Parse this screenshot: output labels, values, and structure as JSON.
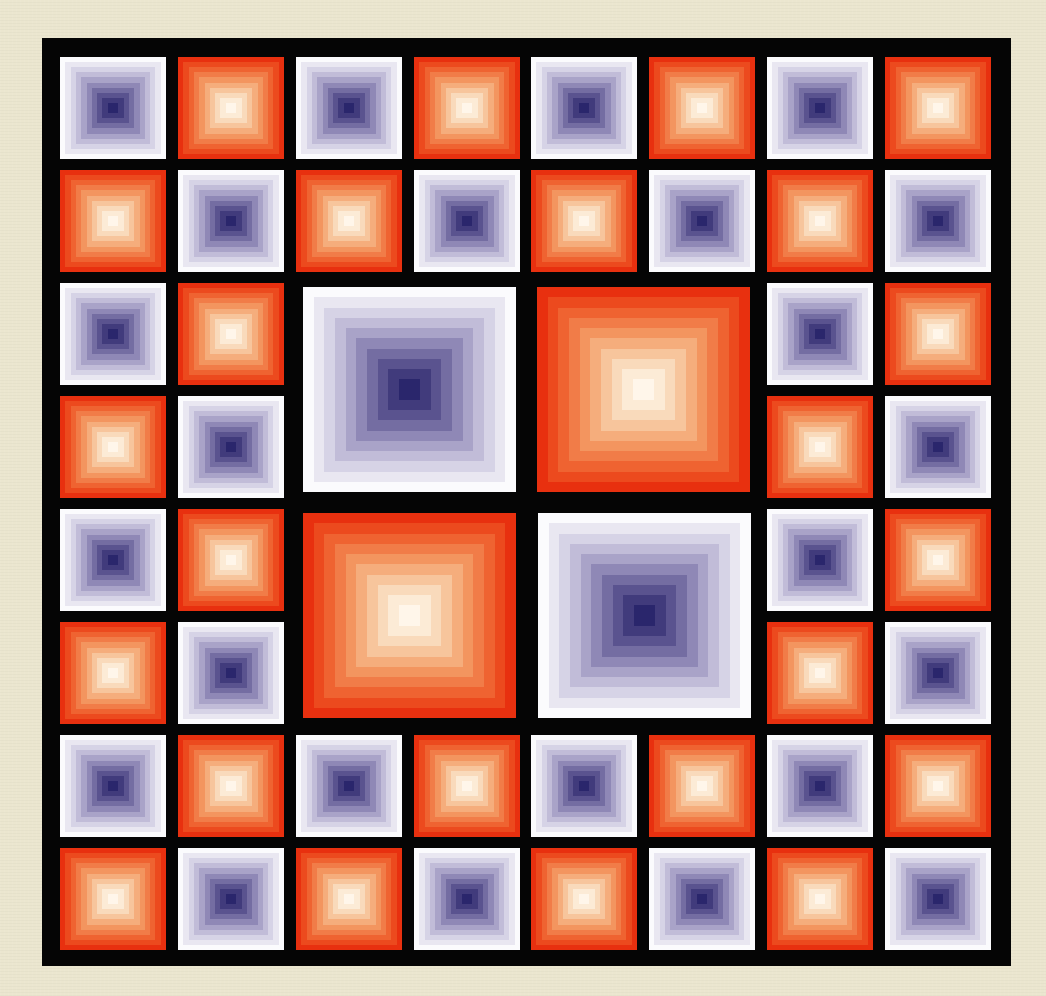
{
  "artwork": {
    "title": "Concentric squares grid artwork",
    "background_color": "#ebe6cf",
    "frame_color": "#050505",
    "grid": {
      "rows": 8,
      "cols": 8
    },
    "palettes": {
      "warm": [
        "#e8300f",
        "#ec4a1e",
        "#ef6331",
        "#f17c48",
        "#f3955f",
        "#f5ad7c",
        "#f7c59c",
        "#f9dabb",
        "#fcebd6",
        "#fff6ea"
      ],
      "cool": [
        "#fbfbfd",
        "#e9e7f1",
        "#d6d3e6",
        "#c1bcd8",
        "#a9a3c8",
        "#8f88b6",
        "#746da2",
        "#5a538f",
        "#413b7c",
        "#2a266c"
      ]
    },
    "small_tiles": [
      [
        "cool",
        "warm",
        "cool",
        "warm",
        "cool",
        "warm",
        "cool",
        "warm"
      ],
      [
        "warm",
        "cool",
        "warm",
        "cool",
        "warm",
        "cool",
        "warm",
        "cool"
      ],
      [
        "cool",
        "warm",
        null,
        null,
        null,
        null,
        "cool",
        "warm"
      ],
      [
        "warm",
        "cool",
        null,
        null,
        null,
        null,
        "warm",
        "cool"
      ],
      [
        "cool",
        "warm",
        null,
        null,
        null,
        null,
        "cool",
        "warm"
      ],
      [
        "warm",
        "cool",
        null,
        null,
        null,
        null,
        "warm",
        "cool"
      ],
      [
        "cool",
        "warm",
        "cool",
        "warm",
        "cool",
        "warm",
        "cool",
        "warm"
      ],
      [
        "warm",
        "cool",
        "warm",
        "cool",
        "warm",
        "cool",
        "warm",
        "cool"
      ]
    ],
    "large_tiles": [
      {
        "position": "top-left",
        "palette": "cool"
      },
      {
        "position": "top-right",
        "palette": "warm"
      },
      {
        "position": "bottom-left",
        "palette": "warm"
      },
      {
        "position": "bottom-right",
        "palette": "cool"
      }
    ]
  }
}
